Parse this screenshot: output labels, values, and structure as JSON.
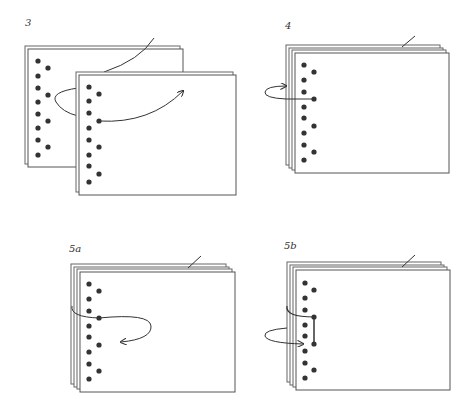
{
  "figure": {
    "colors": {
      "stroke": "#555555",
      "dot": "#333333",
      "paper": "#ffffff",
      "line": "#333333"
    }
  },
  "panels": [
    {
      "id": "3",
      "label": "3",
      "description": "Sheets separated; cord passed through back sheet and threaded through front sheet hole, arrow pointing right"
    },
    {
      "id": "4",
      "label": "4",
      "description": "Sheets stacked; cord loops around spine edge back into hole, arrow pointing in"
    },
    {
      "id": "5a",
      "label": "5a",
      "description": "Stacked sheets; cord comes out of hole and loops back with arrow pointing left"
    },
    {
      "id": "5b",
      "label": "5b",
      "description": "Stacked sheets; cord runs vertically between two holes and loops around spine into lower hole"
    }
  ]
}
